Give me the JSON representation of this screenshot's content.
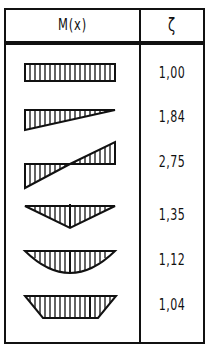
{
  "table": {
    "headers": {
      "moment": "M(x)",
      "factor": "ζ"
    },
    "rows": [
      {
        "diagram": "constant-moment-rectangle",
        "value": "1,00"
      },
      {
        "diagram": "linear-moment-triangle",
        "value": "1,84"
      },
      {
        "diagram": "antisymmetric-linear-moment",
        "value": "2,75"
      },
      {
        "diagram": "triangular-point-load-moment",
        "value": "1,35"
      },
      {
        "diagram": "parabolic-uniform-load-moment",
        "value": "1,12"
      },
      {
        "diagram": "trapezoidal-moment",
        "value": "1,04"
      }
    ]
  },
  "colors": {
    "ink": "#111111",
    "background": "#ffffff"
  }
}
